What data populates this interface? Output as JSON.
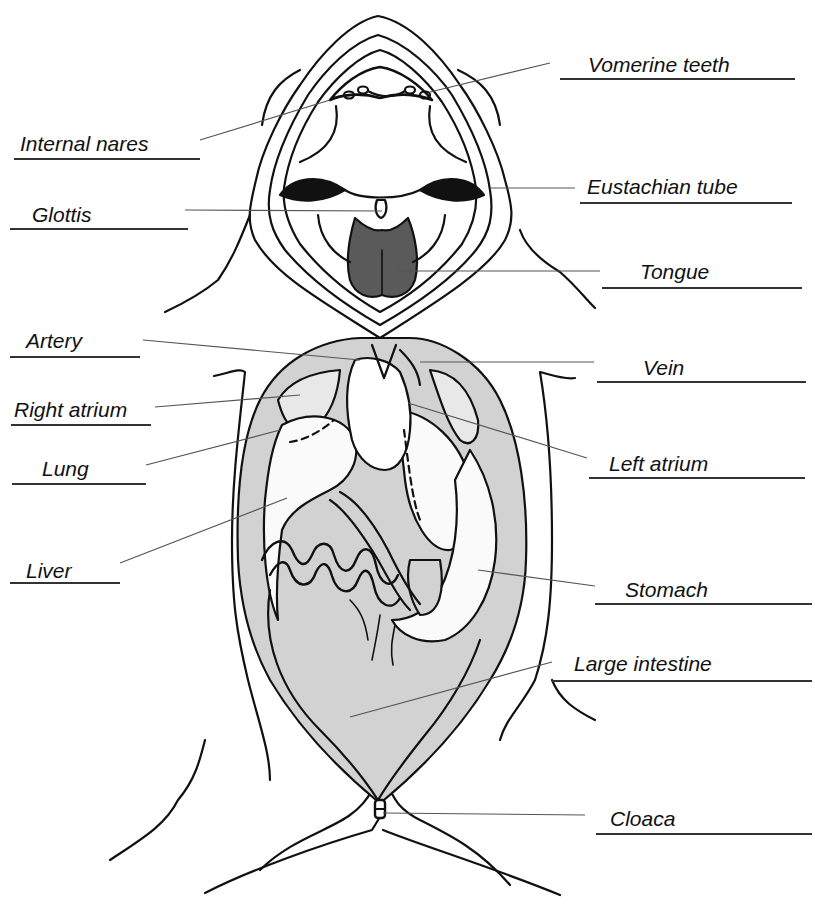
{
  "diagram": {
    "colors": {
      "ink": "#111111",
      "organ_shading": "#d2d2d2",
      "tongue": "#5a5a5a",
      "leader_line": "#555555",
      "background": "#ffffff"
    }
  },
  "labels": [
    {
      "id": "vomerine-teeth",
      "text": "Vomerine teeth",
      "x": 588,
      "y": 54,
      "line": [
        560,
        78,
        795
      ],
      "leader": [
        [
          550,
          63
        ],
        [
          430,
          92
        ]
      ]
    },
    {
      "id": "internal-nares",
      "text": "Internal nares",
      "x": 20,
      "y": 133,
      "line": [
        14,
        158,
        200
      ],
      "leader": [
        [
          200,
          140
        ],
        [
          330,
          100
        ]
      ]
    },
    {
      "id": "eustachian-tube",
      "text": "Eustachian tube",
      "x": 587,
      "y": 176,
      "line": [
        580,
        202,
        792
      ],
      "leader": [
        [
          575,
          188
        ],
        [
          490,
          188
        ]
      ]
    },
    {
      "id": "glottis",
      "text": "Glottis",
      "x": 32,
      "y": 204,
      "line": [
        10,
        228,
        188
      ],
      "leader": [
        [
          185,
          210
        ],
        [
          382,
          211
        ]
      ]
    },
    {
      "id": "tongue",
      "text": "Tongue",
      "x": 640,
      "y": 261,
      "line": [
        602,
        287,
        802
      ],
      "leader": [
        [
          600,
          271
        ],
        [
          395,
          271
        ]
      ]
    },
    {
      "id": "artery",
      "text": "Artery",
      "x": 26,
      "y": 330,
      "line": [
        10,
        356,
        140
      ],
      "leader": [
        [
          143,
          340
        ],
        [
          360,
          360
        ]
      ]
    },
    {
      "id": "vein",
      "text": "Vein",
      "x": 643,
      "y": 357,
      "line": [
        597,
        381,
        806
      ],
      "leader": [
        [
          594,
          362
        ],
        [
          420,
          362
        ]
      ]
    },
    {
      "id": "right-atrium",
      "text": "Right atrium",
      "x": 14,
      "y": 399,
      "line": [
        11,
        424,
        151
      ],
      "leader": [
        [
          155,
          407
        ],
        [
          300,
          395
        ]
      ]
    },
    {
      "id": "lung",
      "text": "Lung",
      "x": 42,
      "y": 458,
      "line": [
        12,
        483,
        146
      ],
      "leader": [
        [
          146,
          465
        ],
        [
          280,
          430
        ]
      ]
    },
    {
      "id": "left-atrium",
      "text": "Left atrium",
      "x": 609,
      "y": 453,
      "line": [
        589,
        477,
        805
      ],
      "leader": [
        [
          587,
          458
        ],
        [
          408,
          403
        ]
      ]
    },
    {
      "id": "liver",
      "text": "Liver",
      "x": 26,
      "y": 560,
      "line": [
        10,
        582,
        120
      ],
      "leader": [
        [
          120,
          563
        ],
        [
          287,
          498
        ]
      ]
    },
    {
      "id": "stomach",
      "text": "Stomach",
      "x": 625,
      "y": 579,
      "line": [
        595,
        603,
        812
      ],
      "leader": [
        [
          595,
          586
        ],
        [
          478,
          570
        ]
      ]
    },
    {
      "id": "large-intestine",
      "text": "Large intestine",
      "x": 574,
      "y": 653,
      "line": [
        552,
        680,
        812
      ],
      "leader": [
        [
          552,
          662
        ],
        [
          350,
          717
        ]
      ]
    },
    {
      "id": "cloaca",
      "text": "Cloaca",
      "x": 610,
      "y": 808,
      "line": [
        596,
        833,
        812
      ],
      "leader": [
        [
          585,
          815
        ],
        [
          383,
          813
        ]
      ]
    }
  ]
}
